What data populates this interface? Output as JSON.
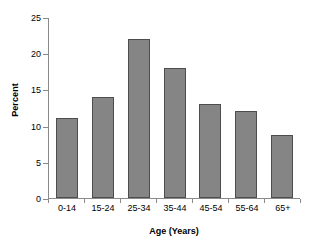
{
  "chart_data": {
    "type": "bar",
    "title": "",
    "subtitle": "",
    "xlabel": "Age (Years)",
    "ylabel": "Percent",
    "categories": [
      "0-14",
      "15-24",
      "25-34",
      "35-44",
      "45-54",
      "55-64",
      "65+"
    ],
    "values": [
      11,
      14,
      22,
      18,
      13,
      12,
      8.7
    ],
    "yticks": [
      0,
      5,
      10,
      15,
      20,
      25
    ],
    "ylim": [
      0,
      25
    ],
    "grid": false,
    "legend": false,
    "legend_position": "none",
    "series": [
      {
        "name": "Percent",
        "values": [
          11,
          14,
          22,
          18,
          13,
          12,
          8.7
        ]
      }
    ],
    "colors": {
      "bar_fill": "#858585",
      "bar_border": "#4d4d4d",
      "axis": "#8a8a8a",
      "text": "#000000",
      "background": "#ffffff"
    }
  }
}
